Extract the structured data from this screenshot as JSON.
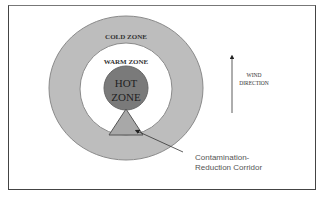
{
  "diagram": {
    "zones": {
      "cold": {
        "label": "COLD ZONE",
        "color": "#bdbdbd"
      },
      "warm": {
        "label": "WARM ZONE",
        "color": "#ffffff"
      },
      "hot": {
        "label_line1": "HOT",
        "label_line2": "ZONE",
        "color": "#7a7a7a"
      }
    },
    "corridor": {
      "label_line1": "Contamination-",
      "label_line2": "Reduction Corridor",
      "color": "#a8a8a8"
    },
    "wind": {
      "label_line1": "WIND",
      "label_line2": "DIRECTION",
      "direction": "up"
    }
  }
}
